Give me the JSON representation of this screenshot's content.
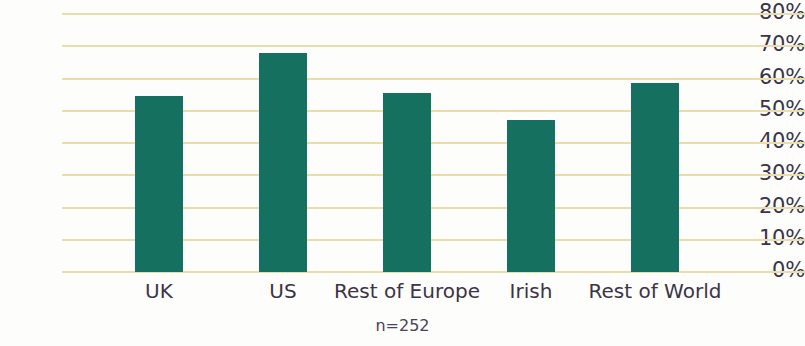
{
  "chart_data": {
    "type": "bar",
    "title": "",
    "subtitle": "",
    "xlabel": "",
    "ylabel": "",
    "categories": [
      "UK",
      "US",
      "Rest of Europe",
      "Irish",
      "Rest of World"
    ],
    "values": [
      54.5,
      68,
      55.5,
      47,
      58.5
    ],
    "ylim": [
      0,
      80
    ],
    "ytick_labels": [
      "80%",
      "70%",
      "60%",
      "50%",
      "40%",
      "30%",
      "20%",
      "10%",
      "0%"
    ],
    "ytick_values": [
      80,
      70,
      60,
      50,
      40,
      30,
      20,
      10,
      0
    ],
    "grid": true,
    "legend": false,
    "annotation": "n=252",
    "series": [
      {
        "name": "",
        "values": [
          54.5,
          68,
          55.5,
          47,
          58.5
        ]
      }
    ]
  },
  "colors": {
    "bar": "#15705f",
    "gridline": "#ebdcab",
    "text": "#3b3447",
    "background": "#fdfdfb"
  }
}
